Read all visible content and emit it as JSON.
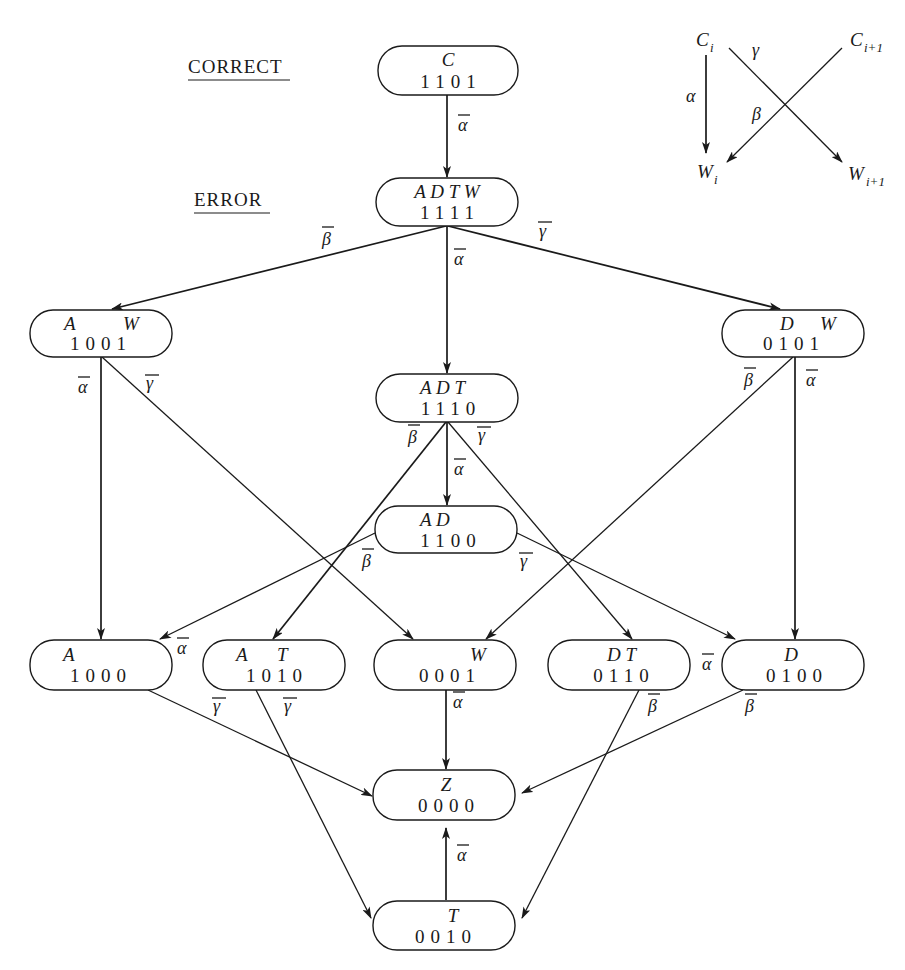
{
  "headings": {
    "correct": "CORRECT",
    "error": "ERROR"
  },
  "legend": {
    "c_i": "C",
    "c_i_sub": "i",
    "c_i1": "C",
    "c_i1_sub": "i+1",
    "w_i": "W",
    "w_i_sub": "i",
    "w_i1": "W",
    "w_i1_sub": "i+1",
    "alpha": "α",
    "beta": "β",
    "gamma": "γ"
  },
  "nodes": {
    "C": {
      "name": "C",
      "bits": "1101"
    },
    "ADTW": {
      "name": "A D T W",
      "bits": "1111"
    },
    "AW": {
      "name": "A      W",
      "bits": "1001"
    },
    "DW": {
      "name": "D     W",
      "bits": "0101"
    },
    "ADT": {
      "name": "A D T",
      "bits": "1110"
    },
    "AD": {
      "name": "A D",
      "bits": "1100"
    },
    "A": {
      "name": "A",
      "bits": "1000"
    },
    "AT": {
      "name": "A     T",
      "bits": "1010"
    },
    "W": {
      "name": "W",
      "bits": "0001"
    },
    "DT": {
      "name": "D T",
      "bits": "0110"
    },
    "D": {
      "name": "D",
      "bits": "0100"
    },
    "Z": {
      "name": "Z",
      "bits": "0000"
    },
    "T": {
      "name": "T",
      "bits": "0010"
    }
  },
  "edges": [
    {
      "from": "C",
      "to": "ADTW",
      "label": "ᾱ"
    },
    {
      "from": "ADTW",
      "to": "AW",
      "label": "β̄"
    },
    {
      "from": "ADTW",
      "to": "ADT",
      "label": "ᾱ"
    },
    {
      "from": "ADTW",
      "to": "DW",
      "label": "γ̄"
    },
    {
      "from": "AW",
      "to": "A",
      "label": "ᾱ"
    },
    {
      "from": "AW",
      "to": "W",
      "label": "γ̄"
    },
    {
      "from": "DW",
      "to": "W",
      "label": "β̄"
    },
    {
      "from": "DW",
      "to": "D",
      "label": "ᾱ"
    },
    {
      "from": "ADT",
      "to": "AT",
      "label": "β̄"
    },
    {
      "from": "ADT",
      "to": "AD",
      "label": "ᾱ"
    },
    {
      "from": "ADT",
      "to": "DT",
      "label": "γ̄"
    },
    {
      "from": "AD",
      "to": "A",
      "label": "β̄"
    },
    {
      "from": "AD",
      "to": "D",
      "label": "γ̄"
    },
    {
      "from": "A",
      "to": "Z",
      "label": "γ̄"
    },
    {
      "from": "AT",
      "to": "T",
      "label": "γ̄"
    },
    {
      "from": "W",
      "to": "Z",
      "label": "ᾱ"
    },
    {
      "from": "DT",
      "to": "T",
      "label": "β̄"
    },
    {
      "from": "D",
      "to": "Z",
      "label": "β̄"
    },
    {
      "from": "T",
      "to": "Z",
      "label": "ᾱ"
    }
  ],
  "edge_labels": {
    "alpha_bar": "α",
    "beta_bar": "β",
    "gamma_bar": "γ"
  },
  "colors": {
    "ink": "#1a1a1a",
    "paper": "#ffffff"
  }
}
